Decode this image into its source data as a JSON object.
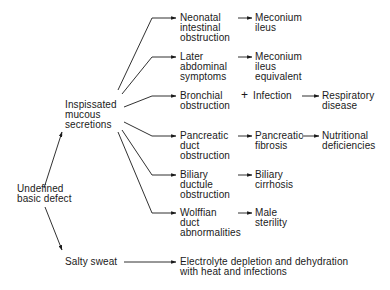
{
  "diagram": {
    "root": "Undefined\nbasic defect",
    "branch_secretions": "Inspissated\nmucous\nsecretions",
    "branch_sweat": "Salty sweat",
    "sweat_outcome": "Electrolyte depletion and dehydration\nwith heat and infections",
    "rows": [
      {
        "cause": "Neonatal\nintestinal\nobstruction",
        "effect": "Meconium\nileus"
      },
      {
        "cause": "Later\nabdominal\nsymptoms",
        "effect": "Meconium\nileus\nequivalent"
      },
      {
        "cause": "Bronchial\nobstruction",
        "plus": "+",
        "effect": "Infection",
        "outcome": "Respiratory\ndisease"
      },
      {
        "cause": "Pancreatic\nduct\nobstruction",
        "effect": "Pancreatic\nfibrosis",
        "outcome": "Nutritional\ndeficiencies"
      },
      {
        "cause": "Biliary\nductule\nobstruction",
        "effect": "Biliary\ncirrhosis"
      },
      {
        "cause": "Wolffian\nduct\nabnormalities",
        "effect": "Male\nsterility"
      }
    ]
  }
}
